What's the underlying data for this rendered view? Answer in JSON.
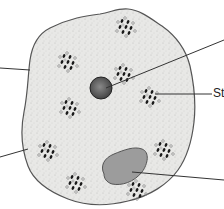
{
  "diagram": {
    "title": "",
    "type": "cell-diagram",
    "colors": {
      "background": "#ffffff",
      "cytoplasm": "#e8e8e6",
      "outline": "#555555",
      "nucleolus": "#6e6e6e",
      "vacuole": "#9c9c9c",
      "granule_dark": "#1a1a1a",
      "granule_light": "#bdbdbd",
      "leader": "#333333"
    },
    "labels": [
      {
        "id": "label-right-middle",
        "text": "St",
        "x": 214,
        "y": 89
      }
    ],
    "leader_lines": [
      {
        "id": "leader-left-upper",
        "x1": 0,
        "y1": 68,
        "x2": 30,
        "y2": 70
      },
      {
        "id": "leader-left-lower",
        "x1": 0,
        "y1": 157,
        "x2": 28,
        "y2": 149
      },
      {
        "id": "leader-top-right",
        "x1": 224,
        "y1": 40,
        "x2": 106,
        "y2": 88
      },
      {
        "id": "leader-right-middle",
        "x1": 212,
        "y1": 94,
        "x2": 155,
        "y2": 94
      },
      {
        "id": "leader-bottom-right",
        "x1": 224,
        "y1": 180,
        "x2": 132,
        "y2": 172
      }
    ],
    "structures": [
      {
        "name": "nucleus-body",
        "cx": 101,
        "cy": 88,
        "rx": 11,
        "ry": 11
      },
      {
        "name": "vacuole",
        "cx": 124,
        "cy": 168
      }
    ],
    "granule_clusters": [
      {
        "cx": 68,
        "cy": 62
      },
      {
        "cx": 124,
        "cy": 74
      },
      {
        "cx": 150,
        "cy": 97
      },
      {
        "cx": 70,
        "cy": 108
      },
      {
        "cx": 48,
        "cy": 151
      },
      {
        "cx": 76,
        "cy": 183
      },
      {
        "cx": 164,
        "cy": 150
      },
      {
        "cx": 137,
        "cy": 190
      },
      {
        "cx": 126,
        "cy": 25
      }
    ]
  }
}
